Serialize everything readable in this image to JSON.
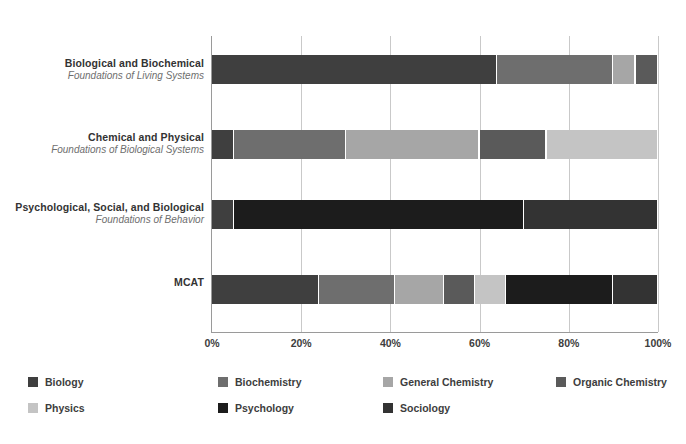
{
  "chart_data": {
    "type": "bar",
    "orientation": "horizontal",
    "stacked": true,
    "normalized": true,
    "title": "",
    "subtitle": "",
    "xlabel": "",
    "ylabel": "",
    "xlim": [
      0,
      100
    ],
    "grid": true,
    "legend_position": "bottom",
    "xticks": [
      "0%",
      "20%",
      "40%",
      "60%",
      "80%",
      "100%"
    ],
    "xtick_values": [
      0,
      20,
      40,
      60,
      80,
      100
    ],
    "categories": [
      {
        "title": "Biological and Biochemical",
        "subtitle": "Foundations of Living Systems"
      },
      {
        "title": "Chemical and Physical",
        "subtitle": "Foundations of Biological Systems"
      },
      {
        "title": "Psychological, Social, and Biological",
        "subtitle": "Foundations of Behavior"
      },
      {
        "title": "MCAT",
        "subtitle": ""
      }
    ],
    "series": [
      {
        "name": "Biology",
        "color": "#3f3f3f",
        "values": [
          64,
          5,
          5,
          24
        ]
      },
      {
        "name": "Biochemistry",
        "color": "#6e6e6e",
        "values": [
          25,
          25,
          0,
          16
        ]
      },
      {
        "name": "General Chemistry",
        "color": "#a6a6a6",
        "values": [
          0,
          30,
          0,
          12
        ]
      },
      {
        "name": "Organic Chemistry",
        "color": "#5a5a5a",
        "values": [
          5,
          15,
          0,
          7
        ]
      },
      {
        "name": "Physics",
        "color": "#c4c4c4",
        "values": [
          0,
          25,
          0,
          8
        ]
      },
      {
        "name": "Psychology",
        "color": "#1c1c1c",
        "values": [
          0,
          0,
          65,
          23
        ]
      },
      {
        "name": "Sociology",
        "color": "#333333",
        "values": [
          6,
          0,
          30,
          10
        ]
      }
    ],
    "bar_stacks": [
      {
        "category": "Biological and Biochemical",
        "segments": [
          {
            "series": "Biology",
            "value": 64,
            "start": 0,
            "end": 64,
            "color": "#3f3f3f"
          },
          {
            "series": "Biochemistry",
            "value": 26,
            "start": 64,
            "end": 90,
            "color": "#6e6e6e"
          },
          {
            "series": "General Chemistry",
            "value": 5,
            "start": 90,
            "end": 95,
            "color": "#a6a6a6"
          },
          {
            "series": "Organic Chemistry",
            "value": 5,
            "start": 95,
            "end": 100,
            "color": "#5a5a5a"
          }
        ]
      },
      {
        "category": "Chemical and Physical",
        "segments": [
          {
            "series": "Biology",
            "value": 5,
            "start": 0,
            "end": 5,
            "color": "#3f3f3f"
          },
          {
            "series": "Biochemistry",
            "value": 25,
            "start": 5,
            "end": 30,
            "color": "#6e6e6e"
          },
          {
            "series": "General Chemistry",
            "value": 30,
            "start": 30,
            "end": 60,
            "color": "#a6a6a6"
          },
          {
            "series": "Organic Chemistry",
            "value": 15,
            "start": 60,
            "end": 75,
            "color": "#5a5a5a"
          },
          {
            "series": "Physics",
            "value": 25,
            "start": 75,
            "end": 100,
            "color": "#c4c4c4"
          }
        ]
      },
      {
        "category": "Psychological, Social, and Biological",
        "segments": [
          {
            "series": "Biology",
            "value": 5,
            "start": 0,
            "end": 5,
            "color": "#3f3f3f"
          },
          {
            "series": "Psychology",
            "value": 65,
            "start": 5,
            "end": 70,
            "color": "#1c1c1c"
          },
          {
            "series": "Sociology",
            "value": 30,
            "start": 70,
            "end": 100,
            "color": "#333333"
          }
        ]
      },
      {
        "category": "MCAT",
        "segments": [
          {
            "series": "Biology",
            "value": 24,
            "start": 0,
            "end": 24,
            "color": "#3f3f3f"
          },
          {
            "series": "Biochemistry",
            "value": 17,
            "start": 24,
            "end": 41,
            "color": "#6e6e6e"
          },
          {
            "series": "General Chemistry",
            "value": 11,
            "start": 41,
            "end": 52,
            "color": "#a6a6a6"
          },
          {
            "series": "Organic Chemistry",
            "value": 7,
            "start": 52,
            "end": 59,
            "color": "#5a5a5a"
          },
          {
            "series": "Physics",
            "value": 7,
            "start": 59,
            "end": 66,
            "color": "#c4c4c4"
          },
          {
            "series": "Psychology",
            "value": 24,
            "start": 66,
            "end": 90,
            "color": "#1c1c1c"
          },
          {
            "series": "Sociology",
            "value": 10,
            "start": 90,
            "end": 100,
            "color": "#333333"
          }
        ]
      }
    ],
    "legend": [
      {
        "label": "Biology",
        "color": "#3f3f3f"
      },
      {
        "label": "Biochemistry",
        "color": "#6e6e6e"
      },
      {
        "label": "General Chemistry",
        "color": "#a6a6a6"
      },
      {
        "label": "Organic Chemistry",
        "color": "#5a5a5a"
      },
      {
        "label": "Physics",
        "color": "#c4c4c4"
      },
      {
        "label": "Psychology",
        "color": "#1c1c1c"
      },
      {
        "label": "Sociology",
        "color": "#333333"
      }
    ]
  },
  "colors": {
    "background": "#ffffff",
    "axis": "#9a9a9a",
    "gridline": "#c9c9c9",
    "text": "#3d3d3d",
    "subtitle_text": "#6e6e6e"
  }
}
